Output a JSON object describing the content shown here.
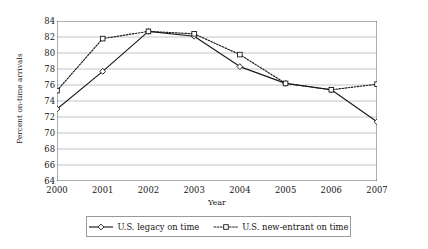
{
  "chart_data": {
    "type": "line",
    "title": "",
    "xlabel": "Year",
    "ylabel": "Percent on-time arrivals",
    "categories": [
      "2000",
      "2001",
      "2002",
      "2003",
      "2004",
      "2005",
      "2006",
      "2007"
    ],
    "x": [
      2000,
      2001,
      2002,
      2003,
      2004,
      2005,
      2006,
      2007
    ],
    "xlim": [
      2000,
      2007
    ],
    "ylim": [
      64,
      84
    ],
    "ytick_step": 2,
    "yticks": [
      64,
      66,
      68,
      70,
      72,
      74,
      76,
      78,
      80,
      82,
      84
    ],
    "grid": "horizontal",
    "legend_position": "bottom",
    "series": [
      {
        "name": "U.S. legacy on time",
        "values": [
          73.0,
          77.7,
          82.7,
          82.1,
          78.3,
          76.2,
          75.4,
          71.4
        ],
        "line_style": "solid",
        "marker": "diamond",
        "color": "#1a1a1a"
      },
      {
        "name": "U.S. new-entrant on time",
        "values": [
          75.3,
          81.8,
          82.7,
          82.4,
          79.8,
          76.2,
          75.4,
          76.1
        ],
        "line_style": "dotted",
        "marker": "square",
        "color": "#1a1a1a"
      }
    ]
  },
  "axis": {
    "y_title": "Percent on-time arrivals",
    "x_title": "Year",
    "y_tick_labels": [
      "84",
      "82",
      "80",
      "78",
      "76",
      "74",
      "72",
      "70",
      "68",
      "66",
      "64"
    ],
    "x_tick_labels": [
      "2000",
      "2001",
      "2002",
      "2003",
      "2004",
      "2005",
      "2006",
      "2007"
    ]
  },
  "legend": {
    "items": [
      {
        "label": "U.S. legacy on time",
        "marker": "diamond-marker",
        "style": "solid"
      },
      {
        "label": "U.S. new-entrant on time",
        "marker": "square-marker",
        "style": "dotted"
      }
    ]
  },
  "colors": {
    "ink": "#1a1a1a",
    "gridline": "#b5b5b5",
    "axis": "#4a4a4a",
    "legend_border": "#9a9a9a",
    "background": "#ffffff"
  }
}
